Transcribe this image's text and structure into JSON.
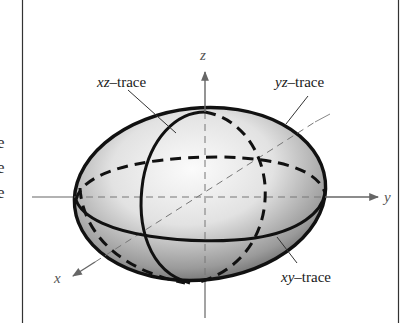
{
  "figure": {
    "left_margin_text": [
      "e",
      "e",
      "e"
    ],
    "axes": {
      "x": "x",
      "y": "y",
      "z": "z"
    },
    "labels": {
      "xz": {
        "var": "xz",
        "suffix": "–trace"
      },
      "yz": {
        "var": "yz",
        "suffix": "–trace"
      },
      "xy": {
        "var": "xy",
        "suffix": "–trace"
      }
    },
    "colors": {
      "frame": "#333333",
      "axis": "#666666",
      "trace": "#111111",
      "surface_light": "#f4f4f4",
      "surface_dark": "#6e6e6e"
    }
  }
}
